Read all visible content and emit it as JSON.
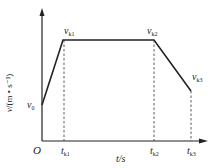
{
  "diagram": {
    "type": "velocity-time graph",
    "y_axis_label": "v/(m • s⁻¹)",
    "y_axis_var": "v",
    "y_axis_unit": "/(m • s⁻¹)",
    "x_axis_label": "t/s",
    "origin_label": "O",
    "points": [
      {
        "name": "v0",
        "label": "v",
        "sub": "0"
      },
      {
        "name": "vk1",
        "label": "v",
        "sub": "k1"
      },
      {
        "name": "vk2",
        "label": "v",
        "sub": "k2"
      },
      {
        "name": "vk3",
        "label": "v",
        "sub": "k3"
      }
    ],
    "ticks": [
      {
        "name": "tk1",
        "label": "t",
        "sub": "k1"
      },
      {
        "name": "tk2",
        "label": "t",
        "sub": "k2"
      },
      {
        "name": "tk3",
        "label": "t",
        "sub": "k3"
      }
    ],
    "line_color": "#222222"
  }
}
